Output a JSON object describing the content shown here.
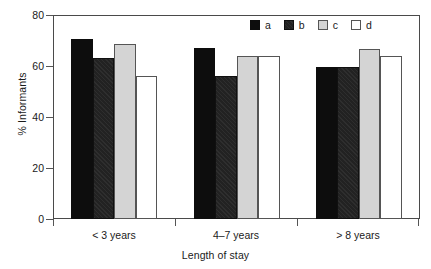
{
  "chart_data": {
    "type": "bar",
    "title": "",
    "subtitle": "",
    "xlabel": "Length of stay",
    "ylabel": "% Informants",
    "categories": [
      "< 3 years",
      "4–7 years",
      "> 8 years"
    ],
    "series": [
      {
        "name": "a",
        "values": [
          70.5,
          67,
          59.5
        ],
        "color": "#0d0d0d"
      },
      {
        "name": "b",
        "values": [
          63,
          56,
          59.5
        ],
        "color": "#222222"
      },
      {
        "name": "c",
        "values": [
          68.5,
          64,
          66.5
        ],
        "color": "#d4d4d4"
      },
      {
        "name": "d",
        "values": [
          56,
          64,
          64
        ],
        "color": "#ffffff"
      }
    ],
    "ylim": [
      0,
      80
    ],
    "yticks": [
      0,
      20,
      40,
      60,
      80
    ],
    "ytick_labels": [
      "0",
      "20",
      "40",
      "60",
      "80"
    ],
    "grid": false,
    "legend_position": "top-right",
    "legend_entries": [
      "a",
      "b",
      "c",
      "d"
    ],
    "axis_color": "#4a4a4a",
    "background": "#ffffff"
  },
  "axes": {
    "y_title": "% Informants",
    "x_title": "Length of stay",
    "y_labels": [
      "80",
      "60",
      "40",
      "20",
      "0"
    ]
  },
  "legend": {
    "items": [
      {
        "label": "a",
        "swatch": "legend-swatch-black"
      },
      {
        "label": "b",
        "swatch": "legend-swatch-dark-gray"
      },
      {
        "label": "c",
        "swatch": "legend-swatch-light-gray"
      },
      {
        "label": "d",
        "swatch": "legend-swatch-white"
      }
    ]
  },
  "x_categories": [
    {
      "label": "< 3 years"
    },
    {
      "label": "4–7 years"
    },
    {
      "label": "> 8 years"
    }
  ]
}
